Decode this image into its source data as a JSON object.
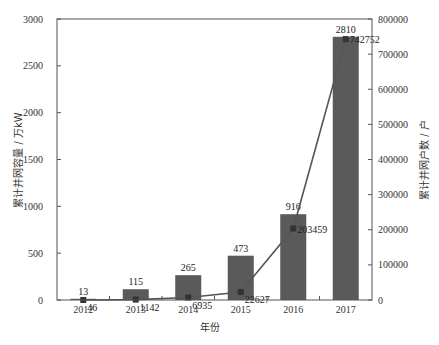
{
  "chart_data": {
    "type": "bar+line",
    "title": "",
    "categories": [
      "2012",
      "2013",
      "2014",
      "2015",
      "2016",
      "2017"
    ],
    "xlabel": "年份",
    "series": [
      {
        "name": "累计并网容量",
        "type": "bar",
        "axis": "left",
        "values": [
          13,
          115,
          265,
          473,
          916,
          2810
        ],
        "color": "#5a5a5a"
      },
      {
        "name": "累计并网户数",
        "type": "line",
        "axis": "right",
        "values": [
          46,
          1142,
          6935,
          22627,
          203459,
          742752
        ],
        "color": "#555555"
      }
    ],
    "ylabel_left": "累计并网容量 / 万kW",
    "ylim_left": [
      0,
      3000
    ],
    "yticks_left": [
      0,
      500,
      1000,
      1500,
      2000,
      2500,
      3000
    ],
    "ylabel_right": "累计并网户数 / 户",
    "ylim_right": [
      0,
      800000
    ],
    "yticks_right": [
      0,
      100000,
      200000,
      300000,
      400000,
      500000,
      600000,
      700000,
      800000
    ],
    "grid": false,
    "legend": "none"
  }
}
